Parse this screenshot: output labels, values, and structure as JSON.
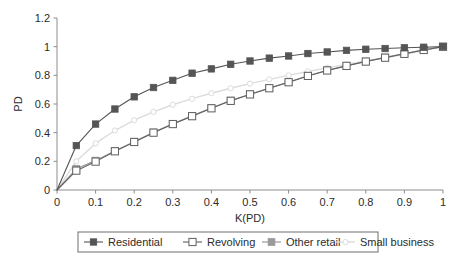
{
  "chart_data": {
    "type": "line",
    "title": "",
    "subtitle": "",
    "xlabel": "K(PD)",
    "ylabel": "PD",
    "xlim": [
      0,
      1
    ],
    "ylim": [
      0,
      1.2
    ],
    "grid": false,
    "legend_position": "bottom",
    "xticks": [
      "0",
      "0.1",
      "0.2",
      "0.3",
      "0.4",
      "0.5",
      "0.6",
      "0.7",
      "0.8",
      "0.9",
      "1"
    ],
    "xtick_values": [
      0,
      0.1,
      0.2,
      0.3,
      0.4,
      0.5,
      0.6,
      0.7,
      0.8,
      0.9,
      1
    ],
    "yticks": [
      "0",
      "0.2",
      "0.4",
      "0.6",
      "0.8",
      "1",
      "1.2"
    ],
    "ytick_values": [
      0,
      0.2,
      0.4,
      0.6,
      0.8,
      1,
      1.2
    ],
    "x": [
      0,
      0.05,
      0.1,
      0.15,
      0.2,
      0.25,
      0.3,
      0.35,
      0.4,
      0.45,
      0.5,
      0.55,
      0.6,
      0.65,
      0.7,
      0.75,
      0.8,
      0.85,
      0.9,
      0.95,
      1
    ],
    "series": [
      {
        "name": "Residential",
        "color": "#555555",
        "marker": "square-filled",
        "marker_size": 3.2,
        "line_width": 1.1,
        "values": [
          0,
          0.31,
          0.46,
          0.565,
          0.65,
          0.715,
          0.765,
          0.815,
          0.845,
          0.877,
          0.9,
          0.92,
          0.935,
          0.952,
          0.963,
          0.974,
          0.982,
          0.987,
          0.992,
          0.996,
          1.0
        ]
      },
      {
        "name": "Revolving",
        "color": "#606060",
        "marker": "square-open",
        "marker_size": 3.6,
        "line_width": 1.1,
        "values": [
          0,
          0.135,
          0.198,
          0.27,
          0.335,
          0.4,
          0.46,
          0.515,
          0.57,
          0.622,
          0.667,
          0.71,
          0.752,
          0.796,
          0.834,
          0.866,
          0.896,
          0.923,
          0.95,
          0.977,
          1.0
        ]
      },
      {
        "name": "Other retail",
        "color": "#9a9a9a",
        "marker": "square-filled",
        "marker_size": 3.4,
        "line_width": 1.2,
        "values": [
          0,
          0.148,
          0.205,
          0.272,
          0.337,
          0.402,
          0.461,
          0.517,
          0.572,
          0.624,
          0.668,
          0.712,
          0.753,
          0.797,
          0.835,
          0.867,
          0.897,
          0.925,
          0.951,
          0.978,
          1.0
        ]
      },
      {
        "name": "Small business",
        "color": "#dcdcdc",
        "marker": "circle-open",
        "marker_size": 2.6,
        "line_width": 1.4,
        "values": [
          0,
          0.2,
          0.325,
          0.415,
          0.487,
          0.545,
          0.595,
          0.637,
          0.675,
          0.71,
          0.742,
          0.772,
          0.8,
          0.827,
          0.852,
          0.876,
          0.9,
          0.922,
          0.945,
          0.972,
          1.0
        ]
      }
    ]
  },
  "legend": {
    "items": [
      {
        "label": "Residential"
      },
      {
        "label": "Revolving"
      },
      {
        "label": "Other retail"
      },
      {
        "label": "Small business"
      }
    ]
  }
}
